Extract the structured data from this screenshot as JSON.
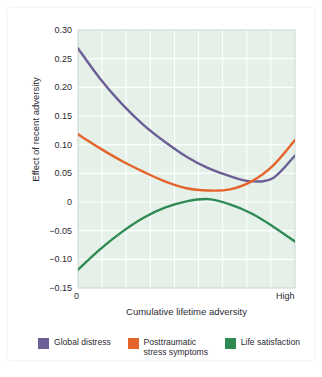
{
  "chart_data": {
    "type": "line",
    "title": "",
    "xlabel": "Cumulative lifetime adversity",
    "ylabel": "Effect of recent adversity",
    "xlim": [
      0,
      1
    ],
    "ylim": [
      -0.15,
      0.3
    ],
    "grid": true,
    "x_tick_labels": [
      "0",
      "High"
    ],
    "y_tick_labels": [
      "0.30",
      "0.25",
      "0.20",
      "0.15",
      "0.10",
      "0.05",
      "0",
      "-0.05",
      "-0.10",
      "-0.15"
    ],
    "y_ticks": [
      0.3,
      0.25,
      0.2,
      0.15,
      0.1,
      0.05,
      0,
      -0.05,
      -0.1,
      -0.15
    ],
    "x_gridlines": 9,
    "legend_position": "bottom",
    "plot_background": "#e4f0e8",
    "gridline_color": "#ffffff",
    "x": [
      0,
      0.1,
      0.2,
      0.3,
      0.4,
      0.5,
      0.6,
      0.7,
      0.8,
      0.9,
      1.0
    ],
    "series": [
      {
        "name": "Global distress",
        "color": "#6b5f96",
        "values": [
          0.268,
          0.216,
          0.172,
          0.135,
          0.105,
          0.079,
          0.059,
          0.045,
          0.036,
          0.042,
          0.081
        ]
      },
      {
        "name": "Posttraumatic stress symptoms",
        "color": "#e4652c",
        "values": [
          0.118,
          0.094,
          0.072,
          0.053,
          0.036,
          0.024,
          0.02,
          0.022,
          0.036,
          0.064,
          0.108
        ]
      },
      {
        "name": "Life satisfaction",
        "color": "#2f8a54",
        "values": [
          -0.118,
          -0.083,
          -0.053,
          -0.028,
          -0.01,
          0.001,
          0.005,
          -0.004,
          -0.02,
          -0.043,
          -0.069
        ]
      }
    ]
  },
  "legend": {
    "items": [
      {
        "label": "Global distress",
        "color": "#6b5f96"
      },
      {
        "label": "Posttraumatic\nstress symptoms",
        "color": "#e4652c"
      },
      {
        "label": "Life satisfaction",
        "color": "#2f8a54"
      }
    ]
  }
}
